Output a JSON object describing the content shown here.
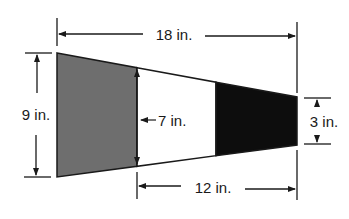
{
  "diagram": {
    "title": "",
    "shape": "trapezoid-band divided into gray, white and black sections",
    "labels": {
      "total_length": "18 in.",
      "left_height": "9 in.",
      "middle_height": "7 in.",
      "right_height": "3 in.",
      "bottom_length": "12 in."
    },
    "colors": {
      "gray_section": "#6e6e6e",
      "white_section": "#ffffff",
      "black_section": "#0d0d0d",
      "lines": "#1a1a1a"
    },
    "geometry": {
      "left_x": 57,
      "right_x": 297,
      "divider_gray_x": 137,
      "divider_black_x": 216,
      "left_top_y": 53,
      "left_bottom_y": 177,
      "right_top_y": 97,
      "right_bottom_y": 145
    }
  }
}
